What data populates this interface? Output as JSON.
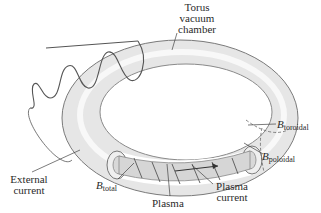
{
  "diagram": {
    "colors": {
      "torus_fill": "#e8e8e8",
      "torus_edge": "#7a7a7a",
      "coil": "#555555",
      "plasma_fill": "#d6d6d6",
      "leader": "#444444",
      "text": "#2a2a2a"
    },
    "labels": {
      "torus": [
        "Torus",
        "vacuum",
        "chamber"
      ],
      "external_current": [
        "External",
        "current"
      ],
      "b_total": {
        "symbol": "B",
        "sub": "total"
      },
      "plasma": "Plasma",
      "plasma_current": [
        "Plasma",
        "current"
      ],
      "b_toroidal": {
        "symbol": "B",
        "sub": "toroidal"
      },
      "b_poloidal": {
        "symbol": "B",
        "sub": "poloidal"
      }
    }
  }
}
